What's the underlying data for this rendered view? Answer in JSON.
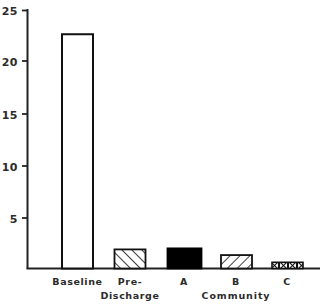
{
  "chart_data": {
    "type": "bar",
    "title": "",
    "subtitle": "",
    "xlabel": "",
    "ylabel": "",
    "categories": [
      "Baseline",
      "Pre-\nDischarge",
      "A",
      "B",
      "C"
    ],
    "category_labels": [
      {
        "line1": "Baseline",
        "line2": ""
      },
      {
        "line1": "Pre-",
        "line2": "Discharge"
      },
      {
        "line1": "A",
        "line2": ""
      },
      {
        "line1": "B",
        "line2": ""
      },
      {
        "line1": "C",
        "line2": ""
      }
    ],
    "values": [
      22.7,
      1.85,
      1.95,
      1.3,
      0.6
    ],
    "bar_fills": [
      "white-open",
      "hatch-forward",
      "solid-black",
      "hatch-backward",
      "crosshatch-boxes"
    ],
    "ylim": [
      0,
      25
    ],
    "yticks": [
      5,
      10,
      15,
      20,
      25
    ],
    "ytick_labels": [
      "5",
      "10",
      "15",
      "20",
      "25"
    ],
    "xticks_visible": false,
    "grid": false,
    "legend": "none",
    "group_label": "Community",
    "group_label_covers": [
      "A",
      "B",
      "C"
    ],
    "axis_color": "#222222",
    "bar_edge_color": "#111111",
    "bar_solid_color": "#000000",
    "background_color": "#ffffff"
  },
  "axis": {
    "y_tick_0": "5",
    "y_tick_1": "10",
    "y_tick_2": "15",
    "y_tick_3": "20",
    "y_tick_4": "25"
  },
  "labels": {
    "baseline": "Baseline",
    "pre": "Pre-",
    "discharge": "Discharge",
    "a": "A",
    "b": "B",
    "c": "C",
    "community": "Community"
  }
}
